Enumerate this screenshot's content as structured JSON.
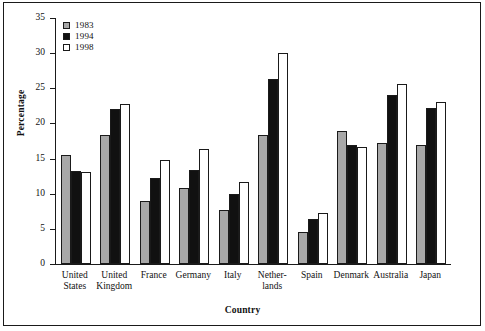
{
  "chart_data": {
    "type": "bar",
    "title": "",
    "xlabel": "Country",
    "ylabel": "Percentage",
    "ylim": [
      0,
      35
    ],
    "yticks": [
      0,
      5,
      10,
      15,
      20,
      25,
      30,
      35
    ],
    "grid": false,
    "legend_position": "top-left",
    "categories": [
      "United\nStates",
      "United\nKingdom",
      "France",
      "Germany",
      "Italy",
      "Nether-\nlands",
      "Spain",
      "Denmark",
      "Australia",
      "Japan"
    ],
    "series": [
      {
        "name": "1983",
        "color": "#a8a8a8",
        "values": [
          15.5,
          18.4,
          8.9,
          10.8,
          7.7,
          18.3,
          4.6,
          18.9,
          17.2,
          17.0
        ]
      },
      {
        "name": "1994",
        "color": "#111111",
        "values": [
          13.2,
          22.0,
          12.2,
          13.4,
          9.9,
          26.3,
          6.4,
          17.0,
          24.0,
          22.2
        ]
      },
      {
        "name": "1998",
        "color": "#ffffff",
        "values": [
          13.1,
          22.7,
          14.8,
          16.3,
          11.6,
          30.0,
          7.3,
          16.6,
          25.6,
          23.0
        ]
      }
    ]
  }
}
